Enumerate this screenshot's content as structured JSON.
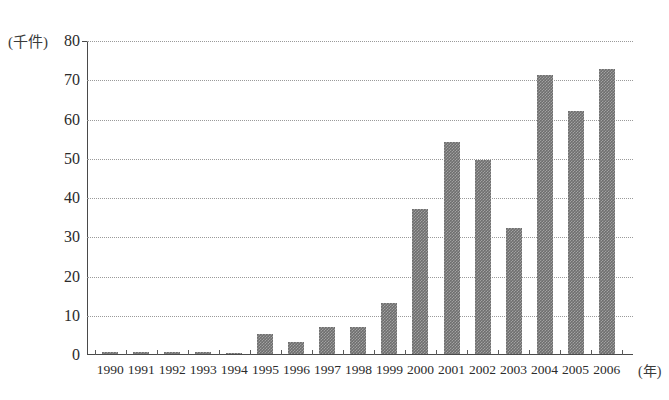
{
  "chart_data": {
    "type": "bar",
    "title": "",
    "subtitle": "",
    "xlabel": "(年)",
    "ylabel": "(千件)",
    "categories": [
      "1990",
      "1991",
      "1992",
      "1993",
      "1994",
      "1995",
      "1996",
      "1997",
      "1998",
      "1999",
      "2000",
      "2001",
      "2002",
      "2003",
      "2004",
      "2005",
      "2006"
    ],
    "values": [
      0.5,
      0.5,
      0.5,
      0.4,
      0.3,
      5,
      3,
      7,
      7,
      13,
      37,
      54,
      49.5,
      32,
      71,
      62,
      72.5
    ],
    "ylim": [
      0,
      80
    ],
    "ytick_labels": [
      "0",
      "10",
      "20",
      "30",
      "40",
      "50",
      "60",
      "70",
      "80"
    ],
    "ytick_values": [
      0,
      10,
      20,
      30,
      40,
      50,
      60,
      70,
      80
    ],
    "grid": "horizontal-dotted",
    "legend": "none",
    "bar_color": "#6e6e6e",
    "axis_color": "#4a4a4a",
    "grid_color": "#9a9a9a",
    "background": "#ffffff"
  }
}
